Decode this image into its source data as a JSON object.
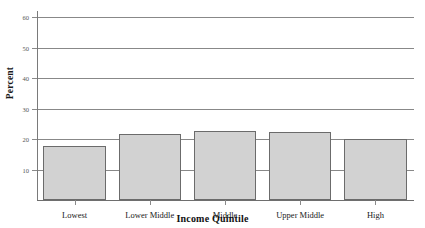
{
  "chart_data": {
    "type": "bar",
    "title": "",
    "title_note": "cropped at top edge of screenshot",
    "xlabel": "Income Quintile",
    "ylabel": "Percent",
    "categories": [
      "Lowest",
      "Lower Middle",
      "Middle",
      "Upper Middle",
      "High"
    ],
    "values": [
      17.8,
      21.8,
      22.5,
      22.4,
      20.0
    ],
    "ylim": [
      0,
      62
    ],
    "yticks": [
      10,
      20,
      30,
      40,
      50,
      60
    ],
    "ytick_labels": [
      "10",
      "20",
      "30",
      "40",
      "50",
      "60"
    ],
    "grid": true,
    "grid_axis": "y",
    "legend": "none",
    "bar_fill": "#d2d2d2",
    "bar_border": "#6b6b6b",
    "gridline_color": "#888888",
    "axis_color": "#7a7a7a",
    "background": "#ffffff"
  }
}
